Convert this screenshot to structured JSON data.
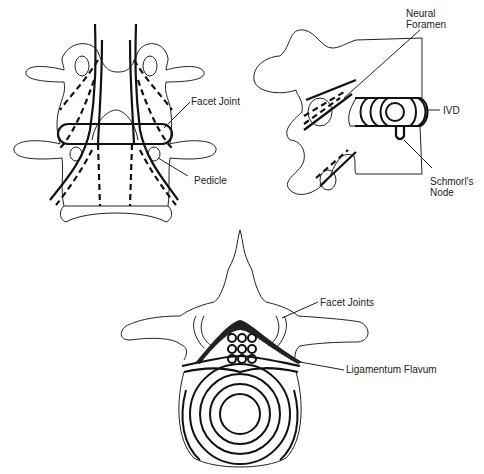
{
  "figures": [
    {
      "id": "posterior-view",
      "description": "Posterior view of two lumbar vertebrae with nerve roots",
      "labels": [
        {
          "key": "facet_joint",
          "text": "Facet Joint"
        },
        {
          "key": "pedicle",
          "text": "Pedicle"
        }
      ]
    },
    {
      "id": "lateral-view",
      "description": "Lateral view of vertebral segment with disc",
      "labels": [
        {
          "key": "neural_foramen_1",
          "text": "Neural"
        },
        {
          "key": "neural_foramen_2",
          "text": "Foramen"
        },
        {
          "key": "ivd",
          "text": "IVD"
        },
        {
          "key": "schmorl_1",
          "text": "Schmorl's"
        },
        {
          "key": "schmorl_2",
          "text": "Node"
        }
      ]
    },
    {
      "id": "axial-view",
      "description": "Axial view of vertebra with disc and spinal canal",
      "labels": [
        {
          "key": "facet_joints",
          "text": "Facet Joints"
        },
        {
          "key": "ligamentum_flavum",
          "text": "Ligamentum Flavum"
        }
      ]
    }
  ],
  "labels": {
    "facet_joint": "Facet Joint",
    "pedicle": "Pedicle",
    "neural": "Neural",
    "foramen": "Foramen",
    "ivd": "IVD",
    "schmorl": "Schmorl's",
    "node": "Node",
    "facet_joints": "Facet Joints",
    "ligamentum_flavum": "Ligamentum Flavum"
  },
  "colors": {
    "line": "#222222",
    "background": "#ffffff"
  }
}
